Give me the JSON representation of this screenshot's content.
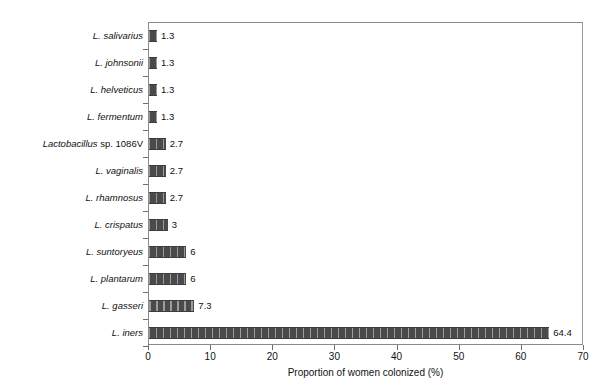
{
  "chart_data": {
    "type": "bar",
    "orientation": "horizontal",
    "title": "",
    "xlabel": "Proportion of women colonized (%)",
    "ylabel": "",
    "xlim": [
      0,
      70
    ],
    "xticks": [
      0,
      10,
      20,
      30,
      40,
      50,
      60,
      70
    ],
    "xtick_labels": [
      "0",
      "10",
      "20",
      "30",
      "40",
      "50",
      "60",
      "70"
    ],
    "grid": false,
    "legend": null,
    "bar_style": {
      "fill": "#4a4a4a",
      "hatch": "vertical-stripes",
      "hatch_color": "#9c9c9c",
      "edge": "#3d3d3d"
    },
    "categories": [
      "L. salivarius",
      "L. johnsonii",
      "L. helveticus",
      "L. fermentum",
      "Lactobacillus sp. 1086V",
      "L. vaginalis",
      "L. rhamnosus",
      "L. crispatus",
      "L. suntoryeus",
      "L. plantarum",
      "L. gasseri",
      "L. iners"
    ],
    "values": [
      1.3,
      1.3,
      1.3,
      1.3,
      2.7,
      2.7,
      2.7,
      3,
      6,
      6,
      7.3,
      64.4
    ],
    "data_labels": [
      "1.3",
      "1.3",
      "1.3",
      "1.3",
      "2.7",
      "2.7",
      "2.7",
      "3",
      "6",
      "6",
      "7.3",
      "64.4"
    ],
    "bars": [
      {
        "category": "L. salivarius",
        "category_italic": "L. salivarius",
        "category_roman": "",
        "value": 1.3,
        "label": "1.3"
      },
      {
        "category": "L. johnsonii",
        "category_italic": "L. johnsonii",
        "category_roman": "",
        "value": 1.3,
        "label": "1.3"
      },
      {
        "category": "L. helveticus",
        "category_italic": "L. helveticus",
        "category_roman": "",
        "value": 1.3,
        "label": "1.3"
      },
      {
        "category": "L. fermentum",
        "category_italic": "L. fermentum",
        "category_roman": "",
        "value": 1.3,
        "label": "1.3"
      },
      {
        "category": "Lactobacillus sp. 1086V",
        "category_italic": "Lactobacillus",
        "category_roman": " sp. 1086V",
        "value": 2.7,
        "label": "2.7"
      },
      {
        "category": "L. vaginalis",
        "category_italic": "L. vaginalis",
        "category_roman": "",
        "value": 2.7,
        "label": "2.7"
      },
      {
        "category": "L. rhamnosus",
        "category_italic": "L. rhamnosus",
        "category_roman": "",
        "value": 2.7,
        "label": "2.7"
      },
      {
        "category": "L. crispatus",
        "category_italic": "L. crispatus",
        "category_roman": "",
        "value": 3,
        "label": "3"
      },
      {
        "category": "L. suntoryeus",
        "category_italic": "L. suntoryeus",
        "category_roman": "",
        "value": 6,
        "label": "6"
      },
      {
        "category": "L. plantarum",
        "category_italic": "L. plantarum",
        "category_roman": "",
        "value": 6,
        "label": "6"
      },
      {
        "category": "L. gasseri",
        "category_italic": "L. gasseri",
        "category_roman": "",
        "value": 7.3,
        "label": "7.3"
      },
      {
        "category": "L. iners",
        "category_italic": "L. iners",
        "category_roman": "",
        "value": 64.4,
        "label": "64.4"
      }
    ]
  }
}
